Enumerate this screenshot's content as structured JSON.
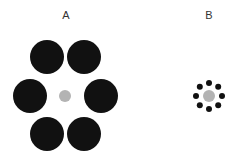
{
  "colors": {
    "background": "#ffffff",
    "inducer": "#111111",
    "target": "#b3b3b3",
    "label": "#333333"
  },
  "panels": [
    {
      "label": "A",
      "label_pos": [
        66,
        19
      ],
      "center": [
        65,
        96
      ],
      "target_radius": 6,
      "inducers": [
        {
          "cx": 47,
          "cy": 57,
          "r": 17
        },
        {
          "cx": 84,
          "cy": 57,
          "r": 17
        },
        {
          "cx": 30,
          "cy": 96,
          "r": 17
        },
        {
          "cx": 101,
          "cy": 96,
          "r": 17
        },
        {
          "cx": 47,
          "cy": 134,
          "r": 17
        },
        {
          "cx": 84,
          "cy": 134,
          "r": 17
        }
      ]
    },
    {
      "label": "B",
      "label_pos": [
        209,
        19
      ],
      "center": [
        209,
        96
      ],
      "target_radius": 6,
      "inducer_ring_radius": 13,
      "inducer_radius": 3,
      "inducer_count": 8
    }
  ]
}
